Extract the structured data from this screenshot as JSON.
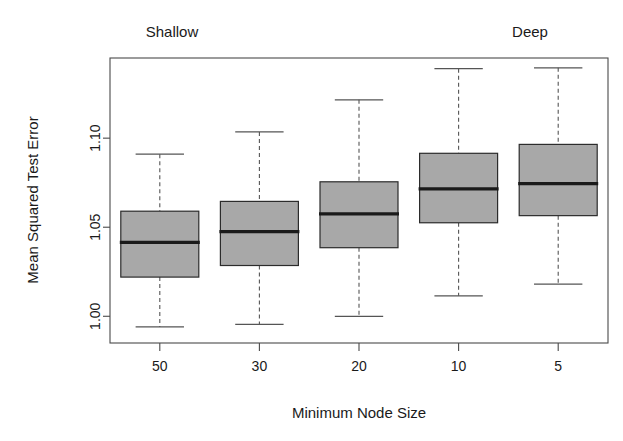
{
  "chart_data": {
    "type": "box",
    "title": "",
    "xlabel": "Minimum Node Size",
    "ylabel": "Mean Squared Test Error",
    "categories": [
      "50",
      "30",
      "20",
      "10",
      "5"
    ],
    "ylim": [
      0.985,
      1.145
    ],
    "yticks": [
      1.0,
      1.05,
      1.1
    ],
    "ytick_labels": [
      "1.00",
      "1.05",
      "1.10"
    ],
    "grid": false,
    "legend": "none",
    "annotations": [
      {
        "text": "Shallow",
        "at_category": "50",
        "position": "above-axis-left"
      },
      {
        "text": "Deep",
        "at_category": "5",
        "position": "above-axis-right"
      }
    ],
    "box_fill_color": "#a8a8a8",
    "box_border_color": "#2b2b2b",
    "median_color": "#1a1a1a",
    "whisker_color": "#555555",
    "boxes": [
      {
        "category": "50",
        "whisker_low": 0.994,
        "q1": 1.022,
        "median": 1.0415,
        "q3": 1.059,
        "whisker_high": 1.091
      },
      {
        "category": "30",
        "whisker_low": 0.9955,
        "q1": 1.0285,
        "median": 1.0475,
        "q3": 1.0645,
        "whisker_high": 1.1035
      },
      {
        "category": "20",
        "whisker_low": 1.0,
        "q1": 1.0385,
        "median": 1.0575,
        "q3": 1.0755,
        "whisker_high": 1.1215
      },
      {
        "category": "10",
        "whisker_low": 1.0115,
        "q1": 1.0525,
        "median": 1.0715,
        "q3": 1.0915,
        "whisker_high": 1.139
      },
      {
        "category": "5",
        "whisker_low": 1.018,
        "q1": 1.0565,
        "median": 1.0745,
        "q3": 1.0965,
        "whisker_high": 1.1395
      }
    ]
  },
  "annotations": {
    "shallow": "Shallow",
    "deep": "Deep"
  },
  "axes": {
    "x_title": "Minimum Node Size",
    "y_title": "Mean Squared Test Error"
  }
}
